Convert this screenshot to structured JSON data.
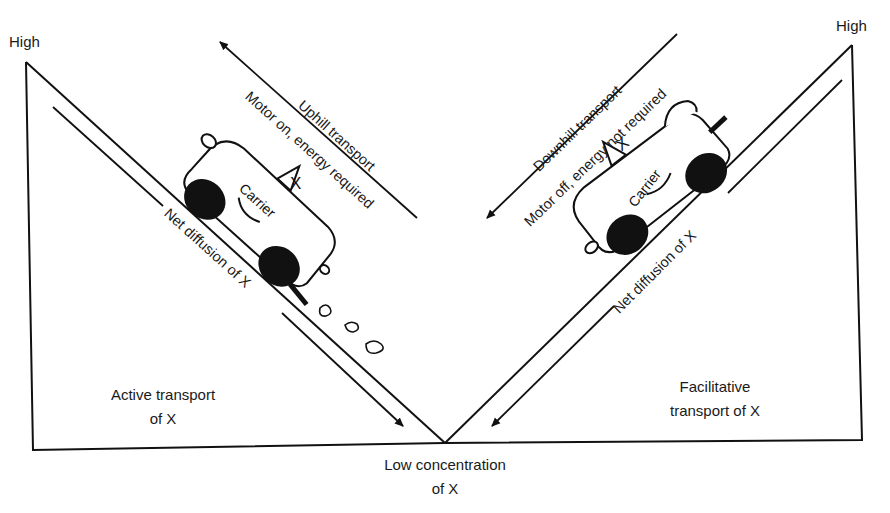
{
  "diagram": {
    "axis": {
      "high_left": "High",
      "high_right": "High",
      "low_line1": "Low concentration",
      "low_line2": "of X"
    },
    "left_panel": {
      "label_line1": "Active transport",
      "label_line2": "of X",
      "arrow_label_line1": "Uphill transport",
      "arrow_label_line2": "Motor on, energy required",
      "diffusion_label": "Net diffusion of X",
      "carrier_label": "Carrier",
      "substance_label": "X",
      "exhaust": true
    },
    "right_panel": {
      "label_line1": "Facilitative",
      "label_line2": "transport of X",
      "arrow_label_line1": "Downhill transport",
      "arrow_label_line2": "Motor off, energy not required",
      "diffusion_label": "Net diffusion of X",
      "carrier_label": "Carrier",
      "substance_label": "X",
      "exhaust": false
    },
    "colors": {
      "line": "#111111",
      "background": "#ffffff"
    }
  }
}
